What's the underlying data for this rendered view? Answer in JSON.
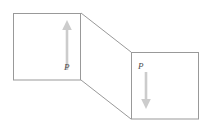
{
  "figure": {
    "name": "shear-block-diagram",
    "background_color": "#ffffff",
    "outline_color": "#999999",
    "arrow_color": "#cccccc",
    "label_color": "#4d4d4d",
    "left_face": {
      "label": "P",
      "arrow_direction": "up",
      "x": 13,
      "y": 13,
      "width": 68,
      "height": 67
    },
    "right_face": {
      "label": "P",
      "arrow_direction": "down",
      "x": 131,
      "y": 52,
      "width": 68,
      "height": 67
    },
    "connector": {
      "top_from": "81,13",
      "top_to": "131,52",
      "bottom_from": "81,80",
      "bottom_to": "131,119"
    }
  }
}
